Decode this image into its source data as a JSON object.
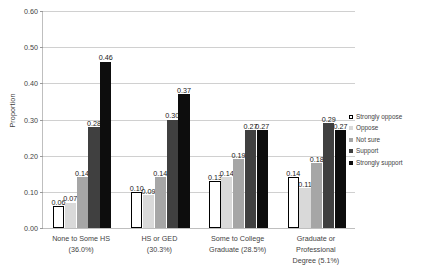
{
  "chart_data": {
    "type": "bar",
    "title": "",
    "subtitle": "",
    "xlabel": "",
    "ylabel": "Proportion",
    "ylim": [
      0.0,
      0.6
    ],
    "ytick_labels": [
      "0.00",
      "0.10",
      "0.20",
      "0.30",
      "0.40",
      "0.50",
      "0.60"
    ],
    "ytick_values": [
      0.0,
      0.1,
      0.2,
      0.3,
      0.4,
      0.5,
      0.6
    ],
    "grid": "horizontal",
    "legend_position": "right",
    "categories": [
      "None to Some HS (36.0%)",
      "HS or GED (30.3%)",
      "Some to College Graduate (28.5%)",
      "Graduate or Professional Degree (5.1%)"
    ],
    "category_lines": [
      [
        "None to Some HS",
        "(36.0%)"
      ],
      [
        "HS or GED",
        "(30.3%)"
      ],
      [
        "Some to College",
        "Graduate (28.5%)"
      ],
      [
        "Graduate or Professional",
        "Degree (5.1%)"
      ]
    ],
    "series": [
      {
        "name": "Strongly oppose",
        "color": "#ffffff",
        "border": "#000000",
        "values": [
          0.06,
          0.1,
          0.13,
          0.14
        ],
        "labels": [
          "0.06",
          "0.10",
          "0.13",
          "0.14"
        ]
      },
      {
        "name": "Oppose",
        "color": "#d9d9d9",
        "border": "#d9d9d9",
        "values": [
          0.07,
          0.09,
          0.14,
          0.11
        ],
        "labels": [
          "0.07",
          "0.09",
          "0.14",
          "0.11"
        ]
      },
      {
        "name": "Not sure",
        "color": "#a6a6a6",
        "border": "#a6a6a6",
        "values": [
          0.14,
          0.14,
          0.19,
          0.18
        ],
        "labels": [
          "0.14",
          "0.14",
          "0.19",
          "0.18"
        ]
      },
      {
        "name": "Support",
        "color": "#404040",
        "border": "#404040",
        "values": [
          0.28,
          0.3,
          0.27,
          0.29
        ],
        "labels": [
          "0.28",
          "0.30",
          "0.27",
          "0.29"
        ]
      },
      {
        "name": "Strongly support",
        "color": "#0d0d0d",
        "border": "#0d0d0d",
        "values": [
          0.46,
          0.37,
          0.27,
          0.27
        ],
        "labels": [
          "0.46",
          "0.37",
          "0.27",
          "0.27"
        ]
      }
    ]
  }
}
